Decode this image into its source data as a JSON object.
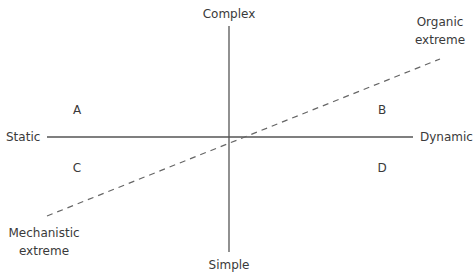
{
  "diagram": {
    "axes": {
      "vertical": {
        "top_label": "Complex",
        "bottom_label": "Simple"
      },
      "horizontal": {
        "left_label": "Static",
        "right_label": "Dynamic"
      }
    },
    "quadrants": {
      "top_left": "A",
      "top_right": "B",
      "bottom_left": "C",
      "bottom_right": "D"
    },
    "diagonal": {
      "style": "dashed",
      "upper_end_label": [
        "Organic",
        "extreme"
      ],
      "lower_end_label": [
        "Mechanistic",
        "extreme"
      ]
    },
    "colors": {
      "axis": "#555555",
      "dash": "#666666",
      "text": "#3a3a3a"
    }
  }
}
